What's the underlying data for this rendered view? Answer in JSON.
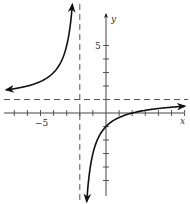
{
  "chart_data": {
    "type": "line",
    "title": "",
    "function": "y = (x - 2) / (x + 2)",
    "xlabel": "x",
    "ylabel": "y",
    "xlim": [
      -8,
      6.3
    ],
    "ylim": [
      -6.7,
      7.3
    ],
    "x_ticks": [
      -7,
      -6,
      -5,
      -4,
      -3,
      -2,
      -1,
      1,
      2,
      3,
      4,
      5,
      6
    ],
    "y_ticks": [
      -5,
      -4,
      -3,
      -2,
      -1,
      1,
      2,
      3,
      4,
      5
    ],
    "tick_labels": {
      "x": [
        "-5"
      ],
      "y": [
        "5"
      ]
    },
    "asymptotes": {
      "vertical": -2,
      "horizontal": 1
    },
    "series": [
      {
        "name": "left branch",
        "x": [
          -8,
          -7,
          -6,
          -5,
          -4,
          -3,
          -2.6,
          -2.5
        ],
        "y": [
          1.67,
          1.8,
          2.0,
          2.33,
          3.0,
          5.0,
          7.67,
          9.0
        ]
      },
      {
        "name": "right branch",
        "x": [
          -1.45,
          -1,
          0,
          1,
          2,
          3,
          4,
          5,
          6
        ],
        "y": [
          -6.27,
          -3.0,
          -1.0,
          -0.33,
          0.0,
          0.2,
          0.33,
          0.43,
          0.5
        ]
      }
    ],
    "intercepts": {
      "x_intercept": 2,
      "y_intercept": -1
    },
    "grid": false,
    "legend": null
  },
  "labels": {
    "x_axis": "x",
    "y_axis": "y",
    "x_tick_minus5": "−5",
    "y_tick_5": "5"
  }
}
